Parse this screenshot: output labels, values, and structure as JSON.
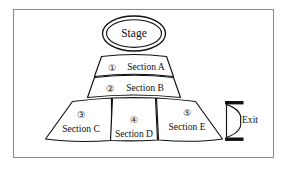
{
  "diagram": {
    "background_color": "#ffffff",
    "border_color": "#8d8d8d",
    "stroke_color": "#111111"
  },
  "stage": {
    "label": "Stage",
    "shape": "double-ellipse"
  },
  "sections": [
    {
      "number": "①",
      "number_plain": "1",
      "label": "Section A",
      "tier": "upper",
      "shape": "curved-band"
    },
    {
      "number": "②",
      "number_plain": "2",
      "label": "Section B",
      "tier": "upper",
      "shape": "curved-band"
    },
    {
      "number": "③",
      "number_plain": "3",
      "label": "Section C",
      "tier": "lower",
      "shape": "fan-segment"
    },
    {
      "number": "④",
      "number_plain": "4",
      "label": "Section D",
      "tier": "lower",
      "shape": "fan-segment"
    },
    {
      "number": "⑤",
      "number_plain": "5",
      "label": "Section E",
      "tier": "lower",
      "shape": "fan-segment"
    }
  ],
  "exit": {
    "label": "Exit",
    "icon": "door-swing-icon"
  }
}
